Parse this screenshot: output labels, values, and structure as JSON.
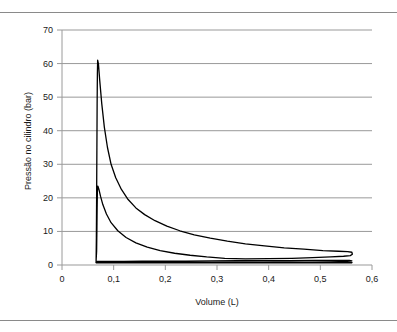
{
  "chart_data": {
    "type": "line",
    "title": "",
    "xlabel": "Volume (L)",
    "ylabel": "Pressão no cilindro (bar)",
    "xlim": [
      0,
      0.6
    ],
    "ylim": [
      0,
      70
    ],
    "xticks": [
      0,
      0.1,
      0.2,
      0.3,
      0.4,
      0.5,
      0.6
    ],
    "xticklabels": [
      "0",
      "0,1",
      "0,2",
      "0,3",
      "0,4",
      "0,5",
      "0,6"
    ],
    "yticks": [
      0,
      10,
      20,
      30,
      40,
      50,
      60,
      70
    ],
    "yticklabels": [
      "0",
      "10",
      "20",
      "30",
      "40",
      "50",
      "60",
      "70"
    ],
    "grid": "horizontal",
    "grid_color": "#999999",
    "line_color": "#000000",
    "legend": "none",
    "series": [
      {
        "name": "compressão-expansão (ciclo de alta pressão)",
        "points": [
          [
            0.066,
            1.3
          ],
          [
            0.0665,
            8.0
          ],
          [
            0.067,
            20.0
          ],
          [
            0.0675,
            34.0
          ],
          [
            0.068,
            48.0
          ],
          [
            0.0685,
            57.0
          ],
          [
            0.069,
            61.0
          ],
          [
            0.0705,
            60.0
          ],
          [
            0.073,
            55.0
          ],
          [
            0.077,
            48.0
          ],
          [
            0.082,
            41.0
          ],
          [
            0.088,
            35.0
          ],
          [
            0.095,
            30.0
          ],
          [
            0.104,
            26.0
          ],
          [
            0.115,
            22.5
          ],
          [
            0.128,
            19.5
          ],
          [
            0.143,
            17.0
          ],
          [
            0.16,
            15.0
          ],
          [
            0.18,
            13.2
          ],
          [
            0.203,
            11.6
          ],
          [
            0.228,
            10.2
          ],
          [
            0.256,
            9.0
          ],
          [
            0.287,
            8.0
          ],
          [
            0.32,
            7.1
          ],
          [
            0.355,
            6.3
          ],
          [
            0.392,
            5.7
          ],
          [
            0.43,
            5.1
          ],
          [
            0.468,
            4.7
          ],
          [
            0.505,
            4.3
          ],
          [
            0.535,
            4.1
          ],
          [
            0.553,
            4.0
          ],
          [
            0.561,
            3.8
          ],
          [
            0.562,
            3.2
          ],
          [
            0.558,
            2.8
          ],
          [
            0.545,
            2.6
          ],
          [
            0.52,
            2.4
          ],
          [
            0.485,
            2.2
          ],
          [
            0.445,
            2.0
          ],
          [
            0.4,
            1.9
          ],
          [
            0.355,
            1.8
          ],
          [
            0.315,
            2.0
          ],
          [
            0.28,
            2.4
          ],
          [
            0.248,
            2.9
          ],
          [
            0.218,
            3.5
          ],
          [
            0.19,
            4.3
          ],
          [
            0.165,
            5.3
          ],
          [
            0.143,
            6.6
          ],
          [
            0.124,
            8.2
          ],
          [
            0.108,
            10.2
          ],
          [
            0.095,
            12.6
          ],
          [
            0.086,
            15.2
          ],
          [
            0.079,
            18.0
          ],
          [
            0.0745,
            20.5
          ],
          [
            0.0715,
            22.5
          ],
          [
            0.0695,
            23.5
          ],
          [
            0.0685,
            22.0
          ],
          [
            0.068,
            17.0
          ],
          [
            0.0675,
            10.0
          ],
          [
            0.067,
            4.0
          ],
          [
            0.066,
            1.3
          ]
        ]
      },
      {
        "name": "admissão-escape (laço de baixa pressão)",
        "points": [
          [
            0.066,
            1.05
          ],
          [
            0.09,
            1.08
          ],
          [
            0.12,
            1.1
          ],
          [
            0.155,
            1.12
          ],
          [
            0.195,
            1.15
          ],
          [
            0.24,
            1.18
          ],
          [
            0.29,
            1.22
          ],
          [
            0.34,
            1.26
          ],
          [
            0.39,
            1.3
          ],
          [
            0.44,
            1.33
          ],
          [
            0.49,
            1.36
          ],
          [
            0.53,
            1.38
          ],
          [
            0.556,
            1.4
          ],
          [
            0.561,
            1.25
          ],
          [
            0.552,
            1.05
          ],
          [
            0.52,
            0.95
          ],
          [
            0.47,
            0.88
          ],
          [
            0.41,
            0.83
          ],
          [
            0.345,
            0.8
          ],
          [
            0.28,
            0.78
          ],
          [
            0.215,
            0.77
          ],
          [
            0.16,
            0.78
          ],
          [
            0.115,
            0.82
          ],
          [
            0.088,
            0.9
          ],
          [
            0.072,
            0.98
          ],
          [
            0.066,
            1.05
          ]
        ]
      },
      {
        "name": "linha de base inferior",
        "points": [
          [
            0.066,
            0.72
          ],
          [
            0.12,
            0.7
          ],
          [
            0.2,
            0.68
          ],
          [
            0.3,
            0.67
          ],
          [
            0.4,
            0.67
          ],
          [
            0.48,
            0.68
          ],
          [
            0.54,
            0.7
          ],
          [
            0.561,
            0.72
          ]
        ]
      }
    ],
    "annotations": {
      "peak_pressure": 61,
      "peak_volume": 0.069,
      "min_volume": 0.066,
      "max_volume": 0.562
    }
  },
  "figure": {
    "top_rule": "",
    "bottom_rule": ""
  }
}
